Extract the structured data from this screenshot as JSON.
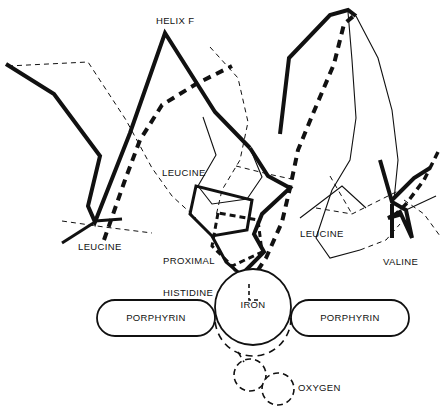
{
  "figure": {
    "kind": "molecular-structure-diagram",
    "background_color": "#ffffff",
    "ink_color": "#111111"
  },
  "labels": {
    "helix_prefix": "HELIX ",
    "helix_letter": "F",
    "leucine_center": "LEUCINE",
    "leucine_left": "LEUCINE",
    "leucine_right": "LEUCINE",
    "valine": "VALINE",
    "proximal_histidine_line1": "PROXIMAL",
    "proximal_histidine_line2": "HISTIDINE",
    "iron": "IRON",
    "porphyrin_left": "PORPHYRIN",
    "porphyrin_right": "PORPHYRIN",
    "oxygen": "OXYGEN"
  },
  "legend_semantics": {
    "thick_solid": "deoxy conformation backbone / side chain",
    "thick_dashed": "oxy conformation backbone / side chain",
    "thin_solid": "secondary chain trace",
    "thin_dashed": "secondary chain trace, alternate conformation"
  },
  "shapes": {
    "iron_circle": {
      "cx": 253,
      "cy": 307,
      "r": 38,
      "style": "solid"
    },
    "iron_circle_shifted": {
      "cx": 253,
      "cy": 318,
      "r": 38,
      "style": "dashed"
    },
    "porphyrin_left_rect": {
      "x": 97,
      "y": 300,
      "w": 118,
      "h": 36,
      "rx": 18
    },
    "porphyrin_right_rect": {
      "x": 291,
      "y": 300,
      "w": 118,
      "h": 36,
      "rx": 18
    },
    "oxygen_circle_1": {
      "cx": 250,
      "cy": 375,
      "r": 16,
      "style": "dashed"
    },
    "oxygen_circle_2": {
      "cx": 278,
      "cy": 389,
      "r": 16,
      "style": "dashed"
    }
  },
  "label_positions": {
    "helix": {
      "x": 144,
      "y": 5
    },
    "leucine_center": {
      "x": 162,
      "y": 168
    },
    "leucine_left": {
      "x": 78,
      "y": 242
    },
    "proximal_histidine": {
      "x": 163,
      "y": 235
    },
    "leucine_right": {
      "x": 300,
      "y": 229
    },
    "valine": {
      "x": 383,
      "y": 257
    },
    "iron": {
      "x": 238,
      "y": 300
    },
    "porphyrin_left": {
      "x": 125,
      "y": 313
    },
    "porphyrin_right": {
      "x": 319,
      "y": 313
    },
    "oxygen": {
      "x": 298,
      "y": 383
    }
  }
}
